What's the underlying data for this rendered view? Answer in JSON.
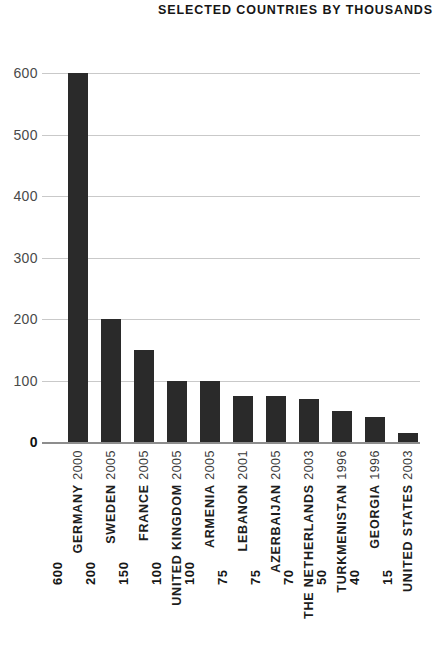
{
  "chart_data": {
    "type": "bar",
    "title": "SELECTED COUNTRIES BY THOUSANDS",
    "xlabel": "",
    "ylabel": "",
    "ylim": [
      0,
      600
    ],
    "yticks": [
      0,
      100,
      200,
      300,
      400,
      500,
      600
    ],
    "ytick_labels": [
      "0",
      "100",
      "200",
      "300",
      "400",
      "500",
      "600"
    ],
    "grid": true,
    "legend": "none",
    "value_labels_shown": true,
    "bar_color": "#2a2a2a",
    "gridline_color": "#c9c9c9",
    "axis_color": "#8d8d8d",
    "background_color": "#ffffff",
    "categories": [
      "GERMANY 2000",
      "SWEDEN 2005",
      "FRANCE 2005",
      "UNITED KINGDOM 2005",
      "ARMENIA 2005",
      "LEBANON 2001",
      "AZERBAIJAN 2005",
      "THE NETHERLANDS 2003",
      "TURKMENISTAN 1996",
      "GEORGIA 1996",
      "UNITED STATES 2003"
    ],
    "values": [
      600,
      200,
      150,
      100,
      100,
      75,
      75,
      70,
      50,
      40,
      15
    ],
    "points": [
      {
        "country": "GERMANY",
        "year": "2000",
        "value": 600,
        "value_label": "600"
      },
      {
        "country": "SWEDEN",
        "year": "2005",
        "value": 200,
        "value_label": "200"
      },
      {
        "country": "FRANCE",
        "year": "2005",
        "value": 150,
        "value_label": "150"
      },
      {
        "country": "UNITED KINGDOM",
        "year": "2005",
        "value": 100,
        "value_label": "100"
      },
      {
        "country": "ARMENIA",
        "year": "2005",
        "value": 100,
        "value_label": "100"
      },
      {
        "country": "LEBANON",
        "year": "2001",
        "value": 75,
        "value_label": "75"
      },
      {
        "country": "AZERBAIJAN",
        "year": "2005",
        "value": 75,
        "value_label": "75"
      },
      {
        "country": "THE NETHERLANDS",
        "year": "2003",
        "value": 70,
        "value_label": "70"
      },
      {
        "country": "TURKMENISTAN",
        "year": "1996",
        "value": 50,
        "value_label": "50"
      },
      {
        "country": "GEORGIA",
        "year": "1996",
        "value": 40,
        "value_label": "40"
      },
      {
        "country": "UNITED STATES",
        "year": "2003",
        "value": 15,
        "value_label": "15"
      }
    ]
  }
}
